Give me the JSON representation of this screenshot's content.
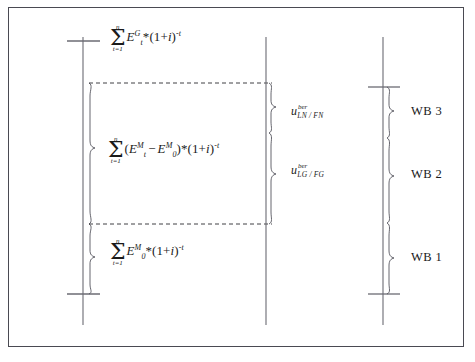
{
  "figure": {
    "type": "economic-valuation-bracket-diagram",
    "background_color": "#ffffff",
    "frame_color": "#4a4a52",
    "line_color": "#6b6b73",
    "text_color": "#1a1a1a"
  },
  "formulas": {
    "top": {
      "id": "formula-top",
      "plain": "sum t=1..n E_t^G * (1+i)^-t",
      "sum_upper": "n",
      "sum_lower": "t=1",
      "base": "E",
      "base_sup": "G",
      "base_sub": "t",
      "factor": "*(1+",
      "rate": "i",
      "factor_close": ")",
      "exponent": "-t"
    },
    "middle": {
      "id": "formula-middle",
      "plain": "sum t=1..n (E_t^M - E_0^M) * (1+i)^-t",
      "sum_upper": "n",
      "sum_lower": "t=1",
      "open": "(",
      "term1_base": "E",
      "term1_sup": "M",
      "term1_sub": "t",
      "minus": "−",
      "term2_base": "E",
      "term2_sup": "M",
      "term2_sub": "0",
      "close": ")",
      "factor": "*(1+",
      "rate": "i",
      "factor_close": ")",
      "exponent": "-t"
    },
    "bottom": {
      "id": "formula-bottom",
      "plain": "sum t=1..n E_0^M * (1+i)^-t",
      "sum_upper": "n",
      "sum_lower": "t=1",
      "base": "E",
      "base_sup": "M",
      "base_sub": "0",
      "factor": "*(1+",
      "rate": "i",
      "factor_close": ")",
      "exponent": "-t"
    }
  },
  "u_labels": [
    {
      "id": "u-label-ln-fn",
      "symbol": "u",
      "superscript": "ber",
      "subscript": "LN / FN",
      "plain": "u^ber_LN/FN"
    },
    {
      "id": "u-label-lg-fg",
      "symbol": "u",
      "superscript": "ber",
      "subscript": "LG / FG",
      "plain": "u^ber_LG/FG"
    }
  ],
  "wb_labels": [
    {
      "id": "wb-3",
      "text": "WB 3"
    },
    {
      "id": "wb-2",
      "text": "WB 2"
    },
    {
      "id": "wb-1",
      "text": "WB 1"
    }
  ],
  "axes": {
    "left": {
      "name": "left-axis",
      "ticks": 2
    },
    "middle": {
      "name": "middle-axis",
      "ticks": 0
    },
    "right": {
      "name": "right-axis",
      "ticks": 2
    }
  },
  "braces": {
    "left_count": 2,
    "middle_count": 2,
    "right_count": 3
  },
  "dashed_connectors": 2
}
